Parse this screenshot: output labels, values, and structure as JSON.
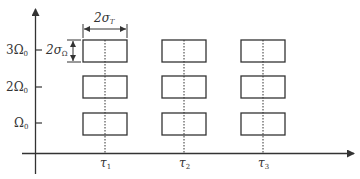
{
  "diagram": {
    "type": "time-frequency tiling",
    "colors": {
      "stroke": "#333333",
      "background": "#ffffff"
    },
    "y_axis": {
      "ticks": [
        {
          "label_main": "3Ω",
          "label_sub": "0",
          "y": 50
        },
        {
          "label_main": "2Ω",
          "label_sub": "0",
          "y": 87
        },
        {
          "label_main": "Ω",
          "label_sub": "0",
          "y": 123
        }
      ]
    },
    "x_axis": {
      "ticks": [
        {
          "label_main": "τ",
          "label_sub": "1",
          "x": 105
        },
        {
          "label_main": "τ",
          "label_sub": "2",
          "x": 184
        },
        {
          "label_main": "τ",
          "label_sub": "3",
          "x": 263
        }
      ]
    },
    "dimensions": {
      "width_label_main": "2σ",
      "width_label_sub": "T",
      "height_label_main": "2σ",
      "height_label_sub": "Ω"
    },
    "boxes": {
      "columns": 3,
      "rows": 3,
      "width": 44,
      "height": 22
    }
  }
}
